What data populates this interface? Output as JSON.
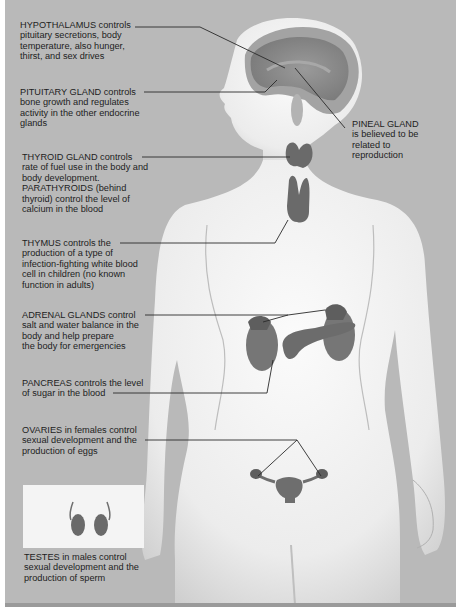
{
  "title_fragment": "",
  "colors": {
    "background": "#b9b9b9",
    "body_skin": "#f1f1f1",
    "gland": "#6e6e6e",
    "leader_line": "#2a2a2a",
    "text": "#1d1d1d"
  },
  "labels": {
    "hypothalamus": {
      "lines": [
        "HYPOTHALAMUS controls",
        "pituitary secretions, body",
        "temperature, also hunger,",
        "thirst, and sex drives"
      ]
    },
    "pituitary": {
      "lines": [
        "PITUITARY GLAND controls",
        "bone growth and regulates",
        "activity in the other endocrine",
        "glands"
      ]
    },
    "pineal": {
      "lines": [
        "PINEAL GLAND",
        "is believed to be",
        "related to",
        "reproduction"
      ]
    },
    "thyroid": {
      "lines": [
        "THYROID GLAND controls",
        "rate of fuel use in the body and",
        "body development.",
        "PARATHYROIDS (behind",
        "thyroid) control the level of",
        "calcium in the blood"
      ]
    },
    "thymus": {
      "lines": [
        "THYMUS controls the",
        "production of a type of",
        "infection-fighting white blood",
        "cell in children (no known",
        "function in adults)"
      ]
    },
    "adrenal": {
      "lines": [
        "ADRENAL GLANDS control",
        "salt and water balance in the",
        "body and help prepare",
        "the body for emergencies"
      ]
    },
    "pancreas": {
      "lines": [
        "PANCREAS controls the level",
        "of sugar in the blood"
      ]
    },
    "ovaries": {
      "lines": [
        "OVARIES in females control",
        "sexual development and the",
        "production of eggs"
      ]
    },
    "testes": {
      "lines": [
        "TESTES in males control",
        "sexual development and the",
        "production of sperm"
      ]
    }
  },
  "glands": [
    "hypothalamus",
    "pituitary",
    "pineal",
    "thyroid",
    "parathyroids",
    "thymus",
    "adrenal",
    "pancreas",
    "ovaries",
    "testes"
  ]
}
